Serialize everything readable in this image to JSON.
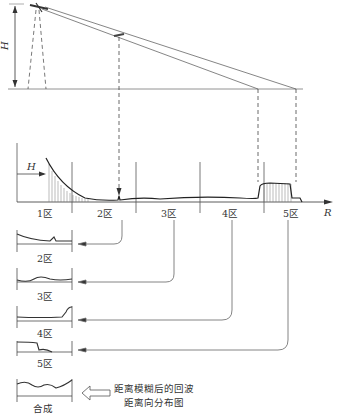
{
  "figure": {
    "height_label": "H",
    "offset_label": "H",
    "axis_label": "R",
    "zones": [
      "1区",
      "2区",
      "3区",
      "4区",
      "5区"
    ],
    "sub_plots": [
      {
        "label": "2区"
      },
      {
        "label": "3区"
      },
      {
        "label": "4区"
      },
      {
        "label": "5区"
      },
      {
        "label": "合成"
      }
    ],
    "caption_line1": "距离模糊后的回波",
    "caption_line2": "距离向分布图"
  },
  "colors": {
    "line": "#333333",
    "light_line": "#777777"
  }
}
